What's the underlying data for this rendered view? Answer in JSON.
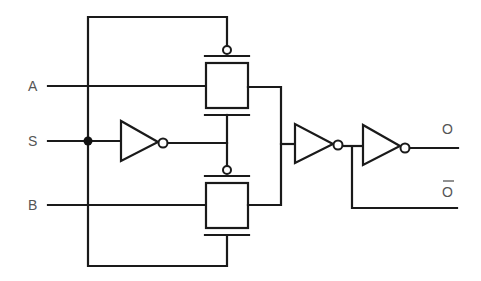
{
  "diagram": {
    "type": "transmission-gate 2:1 multiplexer",
    "inputs": {
      "a": "A",
      "s": "S",
      "b": "B"
    },
    "outputs": {
      "o": "O",
      "o_bar": "O"
    },
    "components": [
      {
        "id": "tg-top",
        "kind": "transmission-gate",
        "data_input": "A"
      },
      {
        "id": "inv-select",
        "kind": "inverter",
        "input": "S"
      },
      {
        "id": "tg-bottom",
        "kind": "transmission-gate",
        "data_input": "B"
      },
      {
        "id": "inv-out-1",
        "kind": "inverter"
      },
      {
        "id": "inv-out-2",
        "kind": "inverter"
      }
    ],
    "colors": {
      "line": "#1a1a1a",
      "label": "#555555",
      "background": "#ffffff"
    }
  }
}
